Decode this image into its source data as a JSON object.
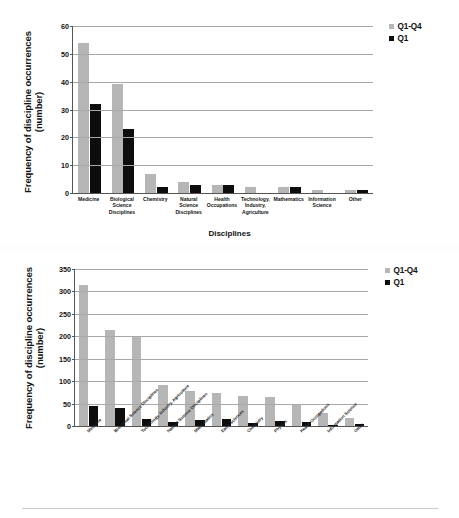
{
  "figure": {
    "background": "#ffffff",
    "series_colors": {
      "q1_q4": "#b6b6b6",
      "q1": "#0d0d0d"
    }
  },
  "legend": {
    "q1_q4_label": "Q1-Q4",
    "q1_label": "Q1"
  },
  "top": {
    "ylabel_line1": "Frequency of discipline occurrences",
    "ylabel_line2": "(number)",
    "xlabel": "Disciplines"
  },
  "bottom": {
    "ylabel_line1": "Frequency of discipline occurrences",
    "ylabel_line2": "(number)"
  },
  "chart_data": [
    {
      "id": "top-chart",
      "type": "bar",
      "title": "",
      "xlabel": "Disciplines",
      "ylabel": "Frequency of discipline occurrences (number)",
      "ylim": [
        0,
        60
      ],
      "yticks": [
        0,
        10,
        20,
        30,
        40,
        50,
        60
      ],
      "grid": true,
      "legend_position": "top-right",
      "categories": [
        "Medicine",
        "Biological Science Disciplines",
        "Chemistry",
        "Natural Science Disciplines",
        "Health Occupations",
        "Technology, Industry, Agriculture",
        "Mathematics",
        "Information Science",
        "Other"
      ],
      "category_lines": [
        [
          "Medicine"
        ],
        [
          "Biological",
          "Science",
          "Disciplines"
        ],
        [
          "Chemistry"
        ],
        [
          "Natural",
          "Science",
          "Disciplines"
        ],
        [
          "Health",
          "Occupations"
        ],
        [
          "Technology,",
          "Industry,",
          "Agriculture"
        ],
        [
          "Mathematics"
        ],
        [
          "Information",
          "Science"
        ],
        [
          "Other"
        ]
      ],
      "series": [
        {
          "name": "Q1-Q4",
          "color": "#b6b6b6",
          "values": [
            54,
            39,
            7,
            4,
            3,
            2,
            2,
            1,
            1
          ]
        },
        {
          "name": "Q1",
          "color": "#0d0d0d",
          "values": [
            32,
            23,
            2,
            3,
            3,
            0,
            2,
            0,
            1
          ]
        }
      ]
    },
    {
      "id": "bottom-chart",
      "type": "bar",
      "title": "",
      "xlabel": "",
      "ylabel": "Frequency of discipline occurrences (number)",
      "ylim": [
        0,
        350
      ],
      "yticks": [
        0,
        50,
        100,
        150,
        200,
        250,
        300,
        350
      ],
      "grid": true,
      "legend_position": "top-right",
      "categories": [
        "Medicine",
        "Biological Science Disciplines",
        "Technology, Industry, Agriculture",
        "Natural Science Disciplines",
        "Mathematics",
        "Earth Sciences",
        "Chemistry",
        "Physics",
        "Health Occupations",
        "Information Science",
        "Other"
      ],
      "series": [
        {
          "name": "Q1-Q4",
          "color": "#b6b6b6",
          "values": [
            315,
            215,
            199,
            92,
            78,
            74,
            67,
            64,
            50,
            30,
            18
          ]
        },
        {
          "name": "Q1",
          "color": "#0d0d0d",
          "values": [
            45,
            41,
            16,
            8,
            13,
            16,
            6,
            11,
            9,
            3,
            4
          ]
        }
      ]
    }
  ]
}
